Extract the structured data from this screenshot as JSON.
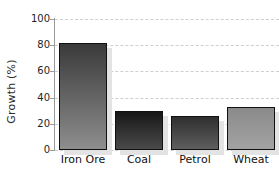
{
  "chart_data": {
    "type": "bar",
    "title": "",
    "xlabel": "",
    "ylabel": "Growth (%)",
    "categories": [
      "Iron Ore",
      "Coal",
      "Petrol",
      "Wheat"
    ],
    "values": [
      82,
      30,
      26,
      33
    ],
    "ylim": [
      0,
      100
    ],
    "yticks": [
      0,
      20,
      40,
      60,
      80,
      100
    ],
    "ytick_labels": [
      "0",
      "20",
      "40",
      "60",
      "80",
      "100"
    ],
    "grid": true,
    "grid_axis": "y",
    "grid_style": "dashed",
    "legend": "none",
    "bar_style": "grayscale vertical gradient with light gray drop shadow",
    "series": [
      {
        "name": "Growth",
        "values": [
          82,
          30,
          26,
          33
        ]
      }
    ],
    "bars": [
      {
        "category": "Iron Ore",
        "value": 82,
        "gradient_top": "#3a3a3a",
        "gradient_bottom": "#8e8e8e"
      },
      {
        "category": "Coal",
        "value": 30,
        "gradient_top": "#171717",
        "gradient_bottom": "#4a4a4a"
      },
      {
        "category": "Petrol",
        "value": 26,
        "gradient_top": "#2e2e2e",
        "gradient_bottom": "#5e5e5e"
      },
      {
        "category": "Wheat",
        "value": 33,
        "gradient_top": "#8a8a8a",
        "gradient_bottom": "#a3a3a3"
      }
    ],
    "colors": {
      "background": "#ffffff",
      "gridline": "#cfcfcf",
      "axis": "#9a9a9a",
      "text": "#1f1f1f",
      "bar_outline": "#111111",
      "bar_shadow": "#e3e3e3"
    }
  }
}
